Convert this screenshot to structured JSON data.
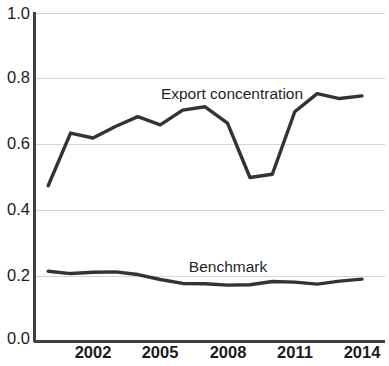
{
  "chart_data": {
    "type": "line",
    "title": "",
    "subtitle": "",
    "xlabel": "",
    "ylabel": "",
    "xlim": [
      2000,
      2014
    ],
    "ylim": [
      0.0,
      1.0
    ],
    "grid": true,
    "legend_position": "inline-annotation",
    "x_tick_labels": [
      "2002",
      "2005",
      "2008",
      "2011",
      "2014"
    ],
    "x_tick_values": [
      2002,
      2005,
      2008,
      2011,
      2014
    ],
    "y_tick_labels": [
      "0.0",
      "0.2",
      "0.4",
      "0.6",
      "0.8",
      "1.0"
    ],
    "y_tick_values": [
      0.0,
      0.2,
      0.4,
      0.6,
      0.8,
      1.0
    ],
    "x": [
      2000,
      2001,
      2002,
      2003,
      2004,
      2005,
      2006,
      2007,
      2008,
      2009,
      2010,
      2011,
      2012,
      2013,
      2014
    ],
    "series": [
      {
        "name": "Export concentration",
        "color": "#333333",
        "values": [
          0.475,
          0.635,
          0.62,
          0.655,
          0.685,
          0.66,
          0.705,
          0.715,
          0.665,
          0.5,
          0.51,
          0.7,
          0.755,
          0.74,
          0.748
        ]
      },
      {
        "name": "Benchmark",
        "color": "#333333",
        "values": [
          0.215,
          0.208,
          0.212,
          0.213,
          0.205,
          0.19,
          0.178,
          0.177,
          0.173,
          0.174,
          0.184,
          0.182,
          0.176,
          0.185,
          0.191
        ]
      }
    ],
    "annotations": [
      {
        "text": "Export concentration",
        "x": 232,
        "y": 95
      },
      {
        "text": "Benchmark",
        "x": 228,
        "y": 268
      }
    ]
  },
  "axes": {
    "plot_left": 34,
    "plot_right": 385,
    "plot_top": 13,
    "plot_bottom": 342,
    "axis_color": "#404040",
    "grid_color": "#d2d7dc"
  }
}
